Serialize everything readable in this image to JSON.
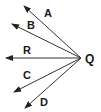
{
  "diagram": {
    "vertex": {
      "label": "Q",
      "x": 81,
      "y": 58
    },
    "rays": [
      {
        "id": "A",
        "label": "A",
        "tip_x": 24,
        "tip_y": 6,
        "label_x": 44,
        "label_y": 17
      },
      {
        "id": "B",
        "label": "B",
        "tip_x": 12,
        "tip_y": 24,
        "label_x": 27,
        "label_y": 29
      },
      {
        "id": "R",
        "label": "R",
        "tip_x": 6,
        "tip_y": 58,
        "label_x": 23,
        "label_y": 54
      },
      {
        "id": "C",
        "label": "C",
        "tip_x": 14,
        "tip_y": 92,
        "label_x": 23,
        "label_y": 79
      },
      {
        "id": "D",
        "label": "D",
        "tip_x": 25,
        "tip_y": 108,
        "label_x": 40,
        "label_y": 106
      }
    ],
    "colors": {
      "line": "#333333",
      "text": "#1a1a1a",
      "background": "#ffffff"
    }
  }
}
